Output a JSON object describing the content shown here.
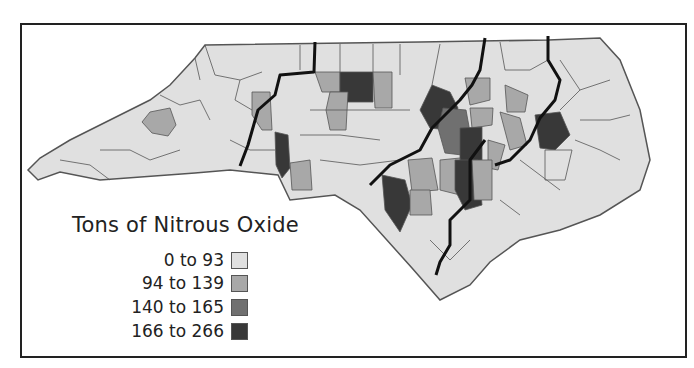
{
  "map": {
    "subject": "North Carolina counties",
    "legend": {
      "title": "Tons of Nitrous Oxide",
      "classes": [
        {
          "label": "0 to 93",
          "color": "#e0e0e0"
        },
        {
          "label": "94 to 139",
          "color": "#a8a8a8"
        },
        {
          "label": "140 to 165",
          "color": "#707070"
        },
        {
          "label": "166 to 266",
          "color": "#383838"
        }
      ]
    },
    "colors": {
      "county_border": "#555555",
      "region_border": "#111111",
      "frame": "#222222",
      "background": "#ffffff"
    }
  }
}
